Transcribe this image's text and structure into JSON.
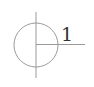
{
  "diagram": {
    "label": "1",
    "stroke_color": "#999999",
    "text_color": "#333333"
  }
}
